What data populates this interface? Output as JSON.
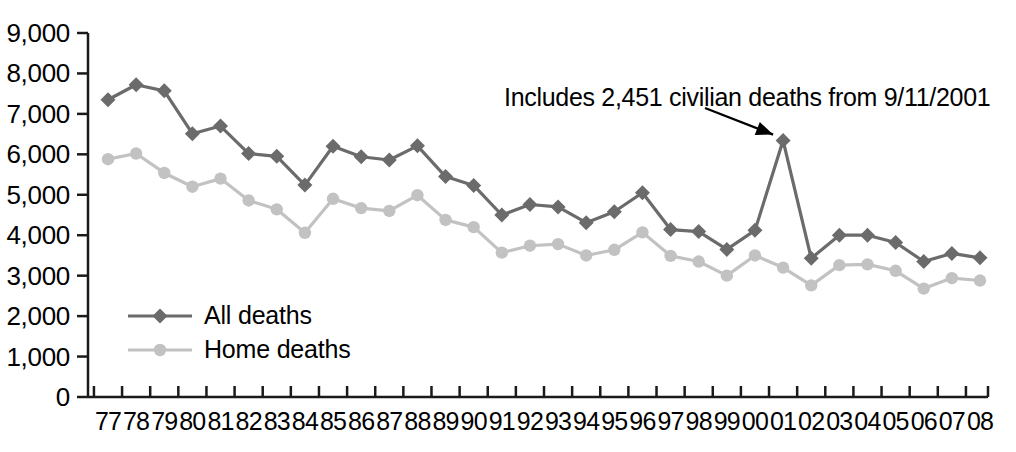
{
  "chart_data": {
    "type": "line",
    "title": "",
    "xlabel": "",
    "ylabel": "",
    "ylim": [
      0,
      9000
    ],
    "y_ticks": [
      0,
      1000,
      2000,
      3000,
      4000,
      5000,
      6000,
      7000,
      8000,
      9000
    ],
    "y_tick_labels": [
      "0",
      "1,000",
      "2,000",
      "3,000",
      "4,000",
      "5,000",
      "6,000",
      "7,000",
      "8,000",
      "9,000"
    ],
    "grid": false,
    "legend_position": "inner-left",
    "categories": [
      "77",
      "78",
      "79",
      "80",
      "81",
      "82",
      "83",
      "84",
      "85",
      "86",
      "87",
      "88",
      "89",
      "90",
      "91",
      "92",
      "93",
      "94",
      "95",
      "96",
      "97",
      "98",
      "99",
      "00",
      "01",
      "02",
      "03",
      "04",
      "05",
      "06",
      "07",
      "08"
    ],
    "x_tick_labels": [
      "77",
      "78",
      "79",
      "80",
      "81",
      "82",
      "83",
      "84",
      "85",
      "86",
      "87",
      "88",
      "89",
      "90",
      "91",
      "92",
      "93",
      "94",
      "95",
      "96",
      "97",
      "98",
      "99",
      "00",
      "01",
      "02",
      "03",
      "04",
      "05",
      "06",
      "07",
      "08"
    ],
    "series": [
      {
        "name": "All deaths",
        "color": "#6b6b6b",
        "marker": "diamond",
        "values": [
          7350,
          7720,
          7570,
          6510,
          6700,
          6020,
          5950,
          5240,
          6200,
          5940,
          5860,
          6210,
          5450,
          5230,
          4500,
          4760,
          4700,
          4310,
          4580,
          5050,
          4140,
          4090,
          3650,
          4120,
          6340,
          3430,
          4000,
          4000,
          3820,
          3350,
          3550,
          3440
        ]
      },
      {
        "name": "Home deaths",
        "color": "#c2c2c2",
        "marker": "circle",
        "values": [
          5880,
          6020,
          5540,
          5200,
          5400,
          4860,
          4640,
          4060,
          4900,
          4670,
          4600,
          4990,
          4380,
          4200,
          3570,
          3740,
          3780,
          3500,
          3640,
          4070,
          3490,
          3350,
          3000,
          3500,
          3200,
          2760,
          3260,
          3280,
          3120,
          2680,
          2940,
          2880
        ]
      }
    ],
    "annotations": [
      {
        "text": "Includes 2,451 civilian deaths from 9/11/2001",
        "points_to_category": "01",
        "points_to_series": "All deaths"
      }
    ]
  },
  "legend": {
    "entries": [
      {
        "label": "All deaths"
      },
      {
        "label": "Home deaths"
      }
    ]
  },
  "colors": {
    "all_deaths": "#6b6b6b",
    "home_deaths": "#c2c2c2",
    "axis": "#1a1a1a",
    "text": "#000000",
    "background": "#ffffff"
  }
}
